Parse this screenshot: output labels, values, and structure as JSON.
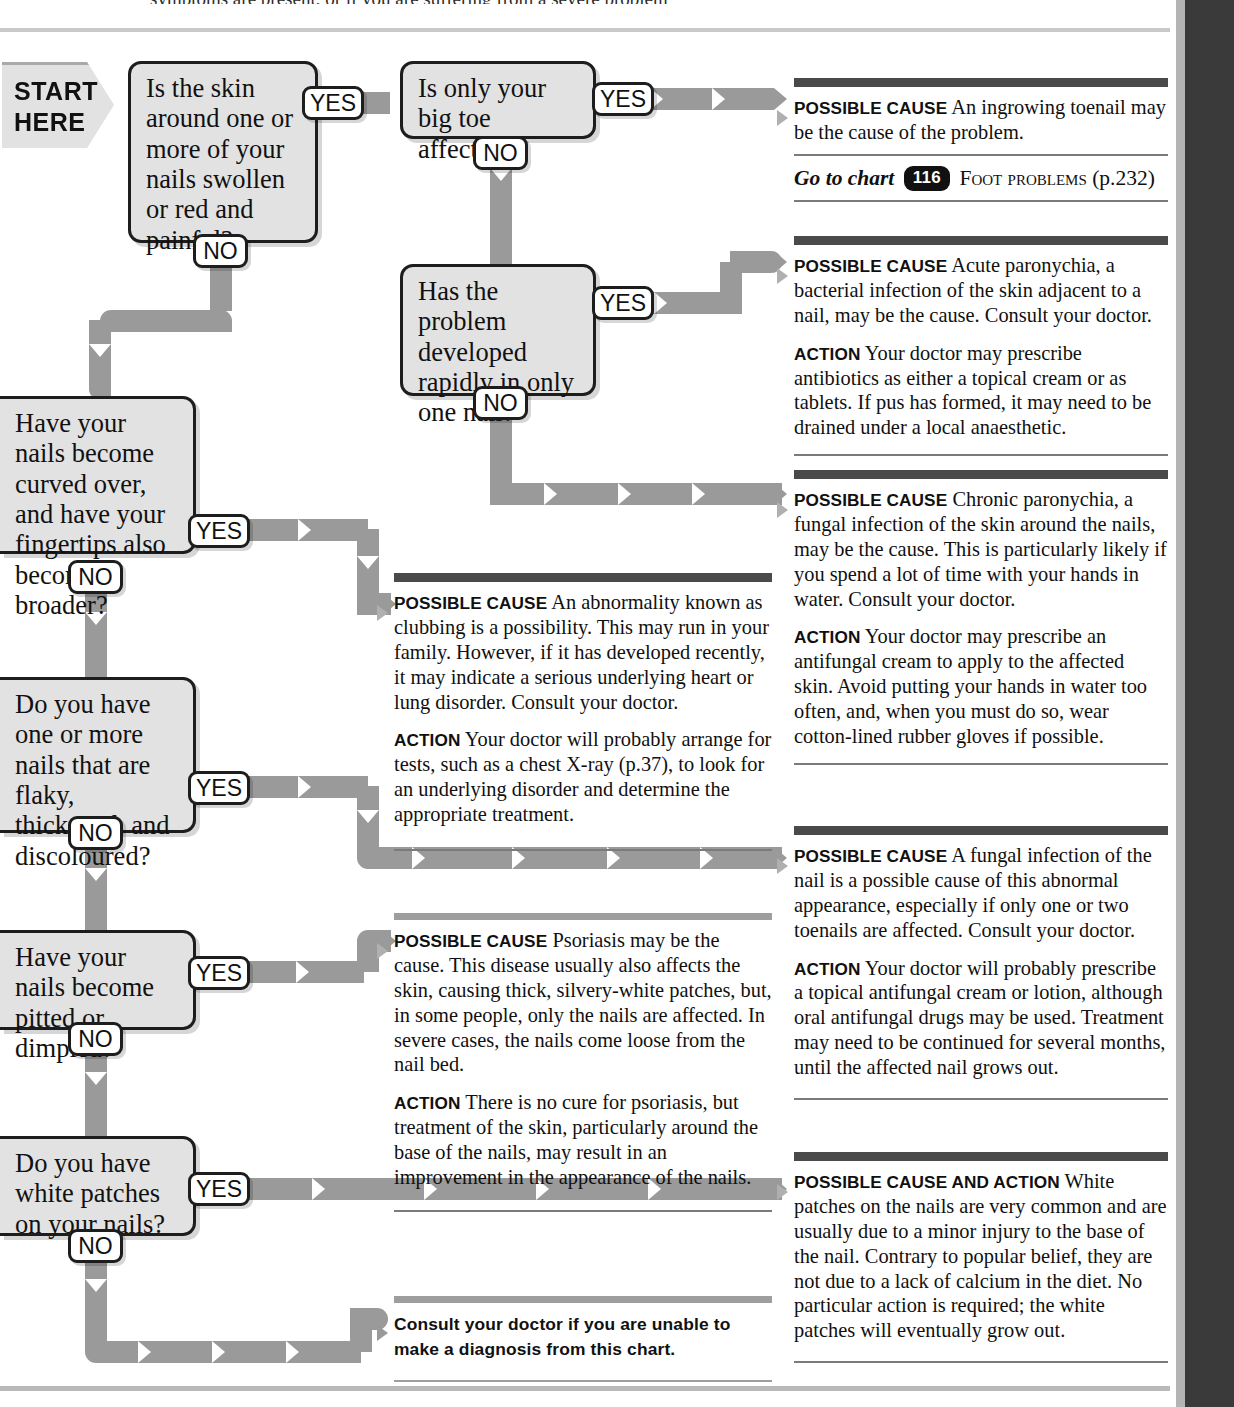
{
  "page": {
    "clipped_header_text": "symptoms are present, or if you are suffering from a severe problem",
    "start_label_line1": "START",
    "start_label_line2": "HERE",
    "yes": "YES",
    "no": "NO"
  },
  "questions": [
    {
      "id": "q1",
      "text": "Is the skin around one or more of your nails swollen or red and painful?"
    },
    {
      "id": "q2",
      "text": "Is only your big toe affected?"
    },
    {
      "id": "q3",
      "text": "Has the problem developed rapidly in only one nail?"
    },
    {
      "id": "q4",
      "text": "Have your nails become curved over, and have your fingertips also become broader?"
    },
    {
      "id": "q5",
      "text": "Do you have one or more nails that are flaky, thickened, and discoloured?"
    },
    {
      "id": "q6",
      "text": "Have your nails become pitted or dimpled?"
    },
    {
      "id": "q7",
      "text": "Do you have white patches on your nails?"
    }
  ],
  "answers": {
    "ingrowing": {
      "cause_label": "Possible cause",
      "cause_text": "An ingrowing toenail may be the cause of the problem.",
      "goto_prefix": "Go to chart",
      "goto_number": "116",
      "goto_name": "Foot problems",
      "goto_page": "(p.232)"
    },
    "acute_paronychia": {
      "cause_label": "Possible cause",
      "cause_text": "Acute paronychia, a bacterial infection of the skin adjacent to a nail, may be the cause. Consult your doctor.",
      "action_label": "Action",
      "action_text": "Your doctor may prescribe antibiotics as either a topical cream or as tablets. If pus has formed, it may need to be drained under a local anaesthetic."
    },
    "chronic_paronychia": {
      "cause_label": "Possible cause",
      "cause_text": "Chronic paronychia, a fungal infection of the skin around the nails, may be the cause. This is particularly likely if you spend a lot of time with your hands in water. Consult your doctor.",
      "action_label": "Action",
      "action_text": "Your doctor may prescribe an antifungal cream to apply to the affected skin. Avoid putting your hands in water too often, and, when you must do so, wear cotton-lined rubber gloves if possible."
    },
    "clubbing": {
      "cause_label": "Possible cause",
      "cause_text": "An abnormality known as clubbing is a possibility. This may run in your family. However, if it has developed recently, it may indicate a serious underlying heart or lung disorder. Consult your doctor.",
      "action_label": "Action",
      "action_text": "Your doctor will probably arrange for tests, such as a chest X-ray (p.37), to look for an underlying disorder and determine the appropriate treatment."
    },
    "fungal_nail": {
      "cause_label": "Possible cause",
      "cause_text": "A fungal infection of the nail is a possible cause of this abnormal appearance, especially if only one or two toenails are affected. Consult your doctor.",
      "action_label": "Action",
      "action_text": "Your doctor will probably prescribe a topical antifungal cream or lotion, although oral antifungal drugs may be used. Treatment may need to be continued for several months, until the affected nail grows out."
    },
    "psoriasis": {
      "cause_label": "Possible cause",
      "cause_text": "Psoriasis may be the cause. This disease usually also affects the skin, causing thick, silvery-white patches, but, in some people, only the nails are affected. In severe cases, the nails come loose from the nail bed.",
      "action_label": "Action",
      "action_text": "There is no cure for psoriasis, but treatment of the skin, particularly around the base of the nails, may result in an improvement in the appearance of the nails."
    },
    "white_patches": {
      "cause_label": "Possible cause and action",
      "cause_text": "White patches on the nails are very common and are usually due to a minor injury to the base of the nail. Contrary to popular belief, they are not due to a lack of calcium in the diet. No particular action is required; the white patches will eventually grow out."
    },
    "final_note": {
      "text": "Consult your doctor if you are unable to make a diagnosis from this chart."
    }
  },
  "colors": {
    "connector": "#9a9a9a",
    "box_fill": "#e2e2e2",
    "box_border": "#1d1d1d",
    "bar_dark": "#4a4a4a",
    "edge_bar": "#3a3a3a"
  }
}
